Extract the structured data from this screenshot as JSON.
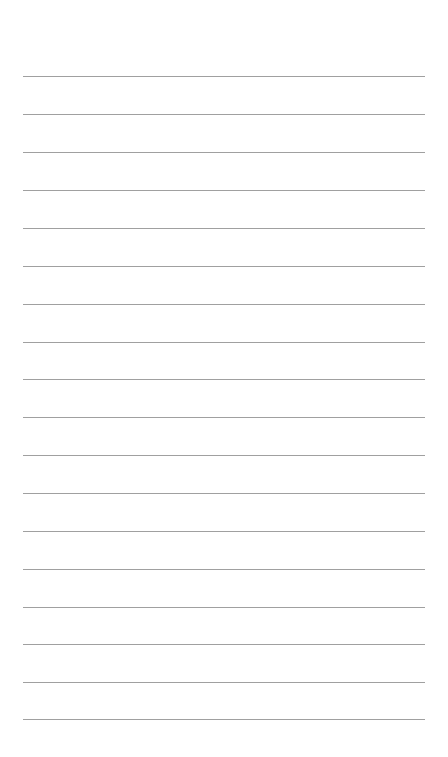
{
  "page": {
    "type": "ruled-paper",
    "background_color": "#ffffff",
    "rule_color": "#8f8f8f",
    "rule_count": 18,
    "rule_left": 23,
    "rule_width": 402,
    "rule_positions": [
      76,
      114,
      152,
      190,
      228,
      266,
      304,
      342,
      379,
      417,
      455,
      493,
      531,
      569,
      607,
      644,
      682,
      719
    ]
  }
}
